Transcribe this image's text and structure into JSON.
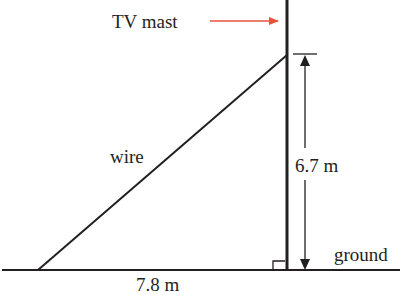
{
  "diagram": {
    "labels": {
      "mast": "TV mast",
      "wire": "wire",
      "height": "6.7 m",
      "base": "7.8 m",
      "ground": "ground"
    },
    "colors": {
      "line": "#231f20",
      "pointer_arrow": "#e8533f"
    },
    "measurements": {
      "height_m": 6.7,
      "base_m": 7.8
    }
  }
}
